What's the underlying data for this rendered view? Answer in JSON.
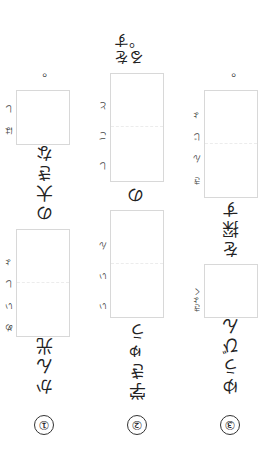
{
  "worksheet": {
    "orientation": "rotated 180 degrees",
    "items": [
      {
        "number": "①",
        "before": "かん光",
        "box1_furigana": "めいしょ",
        "middle": "の大きな",
        "box2_furigana": "はし",
        "end": "。"
      },
      {
        "number": "②",
        "before": "学きゅう",
        "box1_furigana": "いいん",
        "middle": "の",
        "box2_furigana": "しごと",
        "end": "をする。"
      },
      {
        "number": "③",
        "before": "ゆうびん",
        "box1_furigana": "きょく",
        "middle": "を探す",
        "box2_furigana": "きんじょ",
        "end": "。"
      }
    ]
  }
}
